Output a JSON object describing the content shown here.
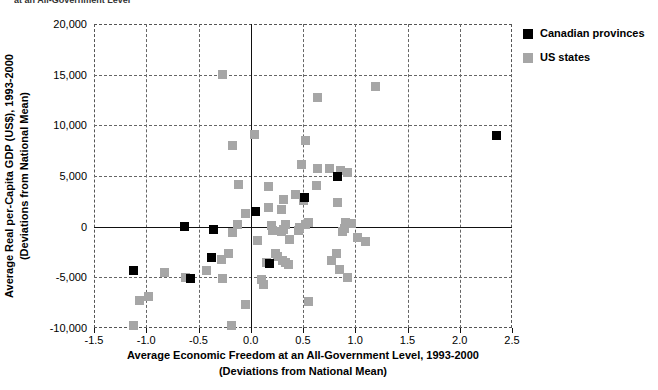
{
  "clipped_heading": "at an All-Government Level",
  "legend": {
    "position": "top-right",
    "items": [
      {
        "label": "Canadian provinces",
        "color": "#000000",
        "key": "canadian-provinces"
      },
      {
        "label": "US states",
        "color": "#a6a6a6",
        "key": "us-states"
      }
    ]
  },
  "chart_data": {
    "type": "scatter",
    "title": "",
    "xlabel_line1": "Average Economic Freedom at an All-Government Level, 1993-2000",
    "xlabel_line2": "(Deviations from National Mean)",
    "ylabel_line1": "Average Real per-Capita GDP (US$), 1993-2000",
    "ylabel_line2": "(Deviations from National Mean)",
    "xlim": [
      -1.5,
      2.5
    ],
    "ylim": [
      -10000,
      20000
    ],
    "xticks": [
      -1.5,
      -1.0,
      -0.5,
      0.0,
      0.5,
      1.0,
      1.5,
      2.0,
      2.5
    ],
    "xticklabels": [
      "-1.5",
      "-1.0",
      "-0.5",
      "0.0",
      "0.5",
      "1.0",
      "1.5",
      "2.0",
      "2.5"
    ],
    "yticks": [
      -10000,
      -5000,
      0,
      5000,
      10000,
      15000,
      20000
    ],
    "yticklabels": [
      "-10,000",
      "-5,000",
      "0",
      "5,000",
      "10,000",
      "15,000",
      "20,000"
    ],
    "grid": true,
    "grid_style": "dashed",
    "zero_lines": {
      "x": 0.0,
      "y": 0
    },
    "series": [
      {
        "name": "US states",
        "key": "us-states",
        "color": "#a6a6a6",
        "points": [
          [
            -0.27,
            15000
          ],
          [
            0.64,
            12700
          ],
          [
            0.04,
            9100
          ],
          [
            0.52,
            8500
          ],
          [
            -0.17,
            8000
          ],
          [
            1.19,
            13800
          ],
          [
            0.93,
            5300
          ],
          [
            -0.12,
            4200
          ],
          [
            0.17,
            4000
          ],
          [
            0.63,
            4100
          ],
          [
            0.64,
            5700
          ],
          [
            0.75,
            5700
          ],
          [
            0.86,
            5500
          ],
          [
            0.49,
            6100
          ],
          [
            0.43,
            3200
          ],
          [
            0.31,
            2700
          ],
          [
            0.5,
            2600
          ],
          [
            0.17,
            1900
          ],
          [
            0.29,
            1700
          ],
          [
            -0.05,
            1300
          ],
          [
            0.83,
            2400
          ],
          [
            0.91,
            400
          ],
          [
            0.96,
            300
          ],
          [
            0.9,
            -200
          ],
          [
            0.88,
            -500
          ],
          [
            0.55,
            400
          ],
          [
            0.52,
            200
          ],
          [
            0.47,
            -100
          ],
          [
            0.46,
            -400
          ],
          [
            0.33,
            200
          ],
          [
            0.31,
            -300
          ],
          [
            0.29,
            -500
          ],
          [
            0.2,
            100
          ],
          [
            0.21,
            -400
          ],
          [
            -0.13,
            200
          ],
          [
            -0.17,
            -600
          ],
          [
            0.06,
            -1400
          ],
          [
            0.37,
            -1300
          ],
          [
            1.02,
            -1100
          ],
          [
            1.1,
            -1500
          ],
          [
            0.82,
            -2600
          ],
          [
            0.77,
            -3300
          ],
          [
            0.24,
            -2600
          ],
          [
            0.26,
            -2900
          ],
          [
            0.3,
            -3300
          ],
          [
            0.33,
            -3500
          ],
          [
            0.36,
            -3700
          ],
          [
            0.15,
            -3500
          ],
          [
            -0.21,
            -2600
          ],
          [
            -0.28,
            -3200
          ],
          [
            -0.42,
            -4300
          ],
          [
            -0.83,
            -4500
          ],
          [
            -0.62,
            -5000
          ],
          [
            -0.27,
            -5100
          ],
          [
            0.1,
            -5200
          ],
          [
            0.12,
            -5700
          ],
          [
            -0.98,
            -6900
          ],
          [
            -1.06,
            -7300
          ],
          [
            -0.05,
            -7700
          ],
          [
            0.55,
            -7400
          ],
          [
            -1.12,
            -9800
          ],
          [
            -0.18,
            -9800
          ],
          [
            0.85,
            -4200
          ],
          [
            0.93,
            -5000
          ]
        ]
      },
      {
        "name": "Canadian provinces",
        "key": "canadian-provinces",
        "color": "#000000",
        "points": [
          [
            2.35,
            9000
          ],
          [
            0.83,
            5000
          ],
          [
            0.51,
            2900
          ],
          [
            0.05,
            1500
          ],
          [
            -0.63,
            0
          ],
          [
            -0.36,
            -300
          ],
          [
            -0.38,
            -3000
          ],
          [
            -1.12,
            -4300
          ],
          [
            -0.58,
            -5100
          ],
          [
            0.18,
            -3600
          ]
        ]
      }
    ]
  }
}
